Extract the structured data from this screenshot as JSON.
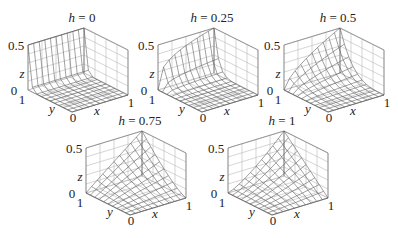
{
  "chart_data": {
    "type": "surface3d",
    "title": "",
    "panels": [
      {
        "title_var": "h",
        "title_value": "0",
        "h": 0,
        "origin": [
          0,
          0
        ]
      },
      {
        "title_var": "h",
        "title_value": "0.25",
        "h": 0.25,
        "origin": [
          130,
          0
        ]
      },
      {
        "title_var": "h",
        "title_value": "0.5",
        "h": 0.5,
        "origin": [
          256,
          0
        ]
      },
      {
        "title_var": "h",
        "title_value": "0.75",
        "h": 0.75,
        "origin": [
          58,
          103
        ]
      },
      {
        "title_var": "h",
        "title_value": "1",
        "h": 1,
        "origin": [
          200,
          103
        ]
      }
    ],
    "xlabel": "x",
    "ylabel": "y",
    "zlabel": "z",
    "xlim": [
      0,
      1
    ],
    "ylim": [
      0,
      1
    ],
    "zlim": [
      0,
      0.5
    ],
    "x_ticks": [
      "0",
      "1"
    ],
    "y_ticks": [
      "0",
      "1"
    ],
    "z_ticks": [
      "0",
      "0.5"
    ],
    "grid": true,
    "mesh_resolution": 10
  },
  "labels": {
    "eq": " = ",
    "x": "x",
    "y": "y",
    "z": "z",
    "tick0": "0",
    "tick1": "1",
    "ztop": "0.5",
    "zbot": "0"
  }
}
